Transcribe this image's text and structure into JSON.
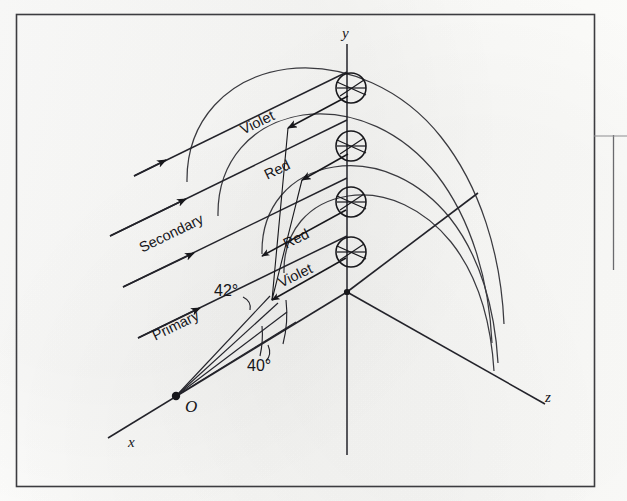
{
  "figure": {
    "kind": "rainbow-formation-optics-diagram",
    "background_color": "#fbfbfa",
    "ink_color": "#1a1a1e",
    "border_color": "#3a3a3e",
    "axes": [
      {
        "id": "y",
        "label": "y",
        "description": "vertical axis through the water droplets"
      },
      {
        "id": "x",
        "label": "x",
        "description": "axis toward the observer at O, lower left"
      },
      {
        "id": "z",
        "label": "z",
        "description": "axis to the lower right"
      }
    ],
    "observer": {
      "label": "O",
      "description": "observer / eye position on the x axis"
    },
    "angles": [
      {
        "label": "40°",
        "belongs_to": "primary rainbow red ray"
      },
      {
        "label": "42°",
        "belongs_to": "primary rainbow violet ray"
      }
    ],
    "ray_labels": [
      {
        "label": "Violet",
        "group": "secondary",
        "rotation_deg": -26
      },
      {
        "label": "Red",
        "group": "secondary",
        "rotation_deg": -26
      },
      {
        "label": "Red",
        "group": "primary",
        "rotation_deg": -26
      },
      {
        "label": "Violet",
        "group": "primary",
        "rotation_deg": -26
      }
    ],
    "beam_labels": [
      {
        "label": "Secondary",
        "description": "parallel sunlight producing the secondary bow",
        "rotation_deg": -26
      },
      {
        "label": "Primary",
        "description": "parallel sunlight producing the primary bow",
        "rotation_deg": -26
      }
    ],
    "droplets": {
      "count": 4,
      "description": "spherical water drops on the y axis with internal refraction and reflection paths"
    },
    "arcs": {
      "count": 4,
      "description": "concentric rainbow arcs sweeping from the droplets down to the z axis"
    }
  }
}
